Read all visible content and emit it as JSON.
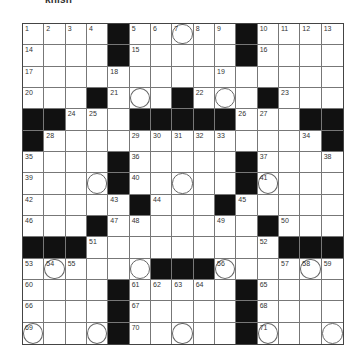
{
  "caption": "knish",
  "puzzle": {
    "size": 15,
    "rows": [
      [
        {
          "n": "1"
        },
        {
          "n": "2"
        },
        {
          "n": "3"
        },
        {
          "n": "4"
        },
        {
          "b": 1
        },
        {
          "n": "5"
        },
        {
          "n": "6"
        },
        {
          "n": "7",
          "c": 1
        },
        {
          "n": "8"
        },
        {
          "n": "9"
        },
        {
          "b": 1
        },
        {
          "n": "10"
        },
        {
          "n": "11"
        },
        {
          "n": "12"
        },
        {
          "n": "13"
        }
      ],
      [
        {
          "n": "14"
        },
        {},
        {},
        {},
        {
          "b": 1
        },
        {
          "n": "15"
        },
        {},
        {},
        {},
        {},
        {
          "b": 1
        },
        {
          "n": "16"
        },
        {},
        {},
        {}
      ],
      [
        {
          "n": "17"
        },
        {},
        {},
        {},
        {
          "n": "18"
        },
        {},
        {},
        {},
        {},
        {
          "n": "19"
        },
        {},
        {},
        {},
        {},
        {}
      ],
      [
        {
          "n": "20"
        },
        {},
        {},
        {
          "b": 1
        },
        {
          "n": "21"
        },
        {
          "c": 1
        },
        {},
        {
          "b": 1
        },
        {
          "n": "22"
        },
        {
          "c": 1
        },
        {},
        {
          "b": 1
        },
        {
          "n": "23"
        },
        {},
        {}
      ],
      [
        {
          "b": 1
        },
        {
          "b": 1
        },
        {
          "n": "24"
        },
        {
          "n": "25"
        },
        {},
        {
          "b": 1
        },
        {
          "b": 1
        },
        {
          "b": 1
        },
        {
          "b": 1
        },
        {
          "b": 1
        },
        {
          "n": "26"
        },
        {
          "n": "27"
        },
        {},
        {
          "b": 1
        },
        {
          "b": 1
        }
      ],
      [
        {
          "b": 1
        },
        {
          "n": "28"
        },
        {},
        {},
        {},
        {
          "n": "29"
        },
        {
          "n": "30"
        },
        {
          "n": "31"
        },
        {
          "n": "32"
        },
        {
          "n": "33"
        },
        {},
        {},
        {},
        {
          "n": "34"
        },
        {
          "b": 1
        }
      ],
      [
        {
          "n": "35"
        },
        {},
        {},
        {},
        {
          "b": 1
        },
        {
          "n": "36"
        },
        {},
        {},
        {},
        {},
        {
          "b": 1
        },
        {
          "n": "37"
        },
        {},
        {},
        {
          "n": "38"
        }
      ],
      [
        {
          "n": "39"
        },
        {},
        {},
        {
          "c": 1
        },
        {
          "b": 1
        },
        {
          "n": "40"
        },
        {},
        {
          "c": 1
        },
        {},
        {},
        {
          "b": 1
        },
        {
          "n": "41",
          "c": 1
        },
        {},
        {},
        {}
      ],
      [
        {
          "n": "42"
        },
        {},
        {},
        {},
        {
          "n": "43"
        },
        {
          "b": 1
        },
        {
          "n": "44"
        },
        {},
        {},
        {
          "b": 1
        },
        {
          "n": "45"
        },
        {},
        {},
        {},
        {}
      ],
      [
        {
          "n": "46"
        },
        {},
        {},
        {
          "b": 1
        },
        {
          "n": "47"
        },
        {
          "n": "48"
        },
        {},
        {},
        {},
        {
          "n": "49"
        },
        {},
        {
          "b": 1
        },
        {
          "n": "50"
        },
        {},
        {}
      ],
      [
        {
          "b": 1
        },
        {
          "b": 1
        },
        {
          "b": 1
        },
        {
          "n": "51"
        },
        {},
        {},
        {},
        {},
        {},
        {},
        {},
        {
          "n": "52"
        },
        {
          "b": 1
        },
        {
          "b": 1
        },
        {
          "b": 1
        }
      ],
      [
        {
          "n": "53"
        },
        {
          "n": "54",
          "c": 1
        },
        {
          "n": "55"
        },
        {},
        {},
        {
          "c": 1
        },
        {
          "b": 1
        },
        {
          "b": 1
        },
        {
          "b": 1
        },
        {
          "n": "56",
          "c": 1
        },
        {},
        {},
        {
          "n": "57"
        },
        {
          "n": "58",
          "c": 1
        },
        {
          "n": "59"
        }
      ],
      [
        {
          "n": "60"
        },
        {},
        {},
        {},
        {
          "b": 1
        },
        {
          "n": "61"
        },
        {
          "n": "62"
        },
        {
          "n": "63"
        },
        {
          "n": "64"
        },
        {},
        {
          "b": 1
        },
        {
          "n": "65"
        },
        {},
        {},
        {}
      ],
      [
        {
          "n": "66"
        },
        {},
        {},
        {},
        {
          "b": 1
        },
        {
          "n": "67"
        },
        {},
        {},
        {},
        {},
        {
          "b": 1
        },
        {
          "n": "68"
        },
        {},
        {},
        {}
      ],
      [
        {
          "n": "69",
          "c": 1
        },
        {},
        {},
        {
          "c": 1
        },
        {
          "b": 1
        },
        {
          "n": "70"
        },
        {},
        {
          "c": 1
        },
        {},
        {},
        {
          "b": 1
        },
        {
          "n": "71",
          "c": 1
        },
        {},
        {},
        {
          "c": 1
        }
      ]
    ]
  }
}
